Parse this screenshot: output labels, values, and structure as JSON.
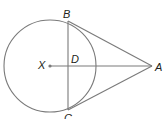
{
  "diagram": {
    "type": "geometry",
    "stroke_color": "#7a7a7a",
    "label_color": "#231f20",
    "points": {
      "X": {
        "label": "X",
        "x": 50,
        "y": 66
      },
      "B": {
        "label": "B",
        "x": 68,
        "y": 21
      },
      "C": {
        "label": "C",
        "x": 68,
        "y": 110
      },
      "D": {
        "label": "D",
        "x": 68,
        "y": 66
      },
      "A": {
        "label": "A",
        "x": 154,
        "y": 66
      }
    },
    "circle": {
      "center": "X",
      "cx": 50,
      "cy": 66,
      "r": 46
    },
    "segments": [
      {
        "from": "A",
        "to": "B"
      },
      {
        "from": "A",
        "to": "C"
      },
      {
        "from": "B",
        "to": "C"
      },
      {
        "from": "X",
        "to": "A"
      }
    ]
  }
}
